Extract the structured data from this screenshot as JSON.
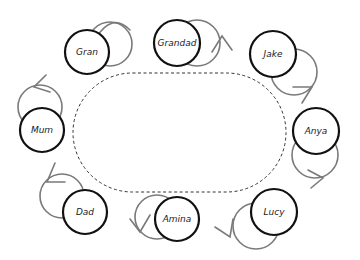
{
  "diagram": {
    "table": {
      "shape": "rounded-oval",
      "style": "dashed",
      "x": 73,
      "y": 73,
      "width": 213,
      "height": 119
    },
    "colors": {
      "seat_stroke": "#111111",
      "arrow_stroke": "#7a7a7a",
      "table_stroke": "#333333"
    },
    "seats": [
      {
        "name": "Gran",
        "cx": 87,
        "cy": 52,
        "r": 22,
        "ghost": {
          "cx": 110,
          "cy": 44
        },
        "arrow": "M96,38 Q112,12 130,30"
      },
      {
        "name": "Grandad",
        "cx": 177,
        "cy": 43,
        "r": 23,
        "ghost": {
          "cx": 197,
          "cy": 43
        },
        "arrow": "M212,52 L222,36 L232,50"
      },
      {
        "name": "Jake",
        "cx": 273,
        "cy": 54,
        "r": 23,
        "ghost": {
          "cx": 294,
          "cy": 72
        },
        "arrow": "M293,87 L312,87 L302,103"
      },
      {
        "name": "Mum",
        "cx": 42,
        "cy": 130,
        "r": 22,
        "ghost": {
          "cx": 40,
          "cy": 107
        },
        "arrow": "M46,75 L34,87 L50,92"
      },
      {
        "name": "Anya",
        "cx": 316,
        "cy": 131,
        "r": 23,
        "ghost": {
          "cx": 315,
          "cy": 155
        },
        "arrow": "M308,170 L323,178 L311,188"
      },
      {
        "name": "Dad",
        "cx": 85,
        "cy": 212,
        "r": 22,
        "ghost": {
          "cx": 62,
          "cy": 196
        },
        "arrow": "M55,163 L47,182 L65,182"
      },
      {
        "name": "Amina",
        "cx": 177,
        "cy": 219,
        "r": 22,
        "ghost": {
          "cx": 157,
          "cy": 217
        },
        "arrow": "M130,219 L140,232 L150,215"
      },
      {
        "name": "Lucy",
        "cx": 274,
        "cy": 212,
        "r": 23,
        "ghost": {
          "cx": 256,
          "cy": 226
        },
        "arrow": "M215,227 L230,237 L233,219"
      }
    ]
  }
}
